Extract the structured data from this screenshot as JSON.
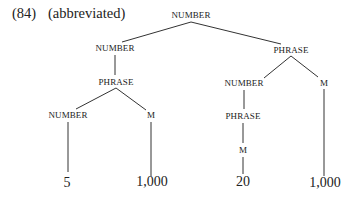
{
  "caption": {
    "number": "(84)",
    "note": "(abbreviated)"
  },
  "tree": {
    "nodes": [
      {
        "id": "n0",
        "label": "NUMBER",
        "x": 191,
        "y": 15,
        "kind": "node"
      },
      {
        "id": "n1",
        "label": "NUMBER",
        "x": 115,
        "y": 48,
        "kind": "node"
      },
      {
        "id": "n2",
        "label": "PHRASE",
        "x": 291,
        "y": 50,
        "kind": "node"
      },
      {
        "id": "n3",
        "label": "PHRASE",
        "x": 116,
        "y": 82,
        "kind": "node"
      },
      {
        "id": "n4",
        "label": "NUMBER",
        "x": 244,
        "y": 83,
        "kind": "node"
      },
      {
        "id": "n5",
        "label": "M",
        "x": 324,
        "y": 83,
        "kind": "node"
      },
      {
        "id": "n6",
        "label": "NUMBER",
        "x": 68,
        "y": 115,
        "kind": "node"
      },
      {
        "id": "n7",
        "label": "M",
        "x": 151,
        "y": 115,
        "kind": "node"
      },
      {
        "id": "n8",
        "label": "PHRASE",
        "x": 243,
        "y": 116,
        "kind": "node"
      },
      {
        "id": "n9",
        "label": "M",
        "x": 243,
        "y": 150,
        "kind": "node"
      },
      {
        "id": "l0",
        "label": "5",
        "x": 67,
        "y": 183,
        "kind": "leaf"
      },
      {
        "id": "l1",
        "label": "1,000",
        "x": 152,
        "y": 182,
        "kind": "leaf"
      },
      {
        "id": "l2",
        "label": "20",
        "x": 243,
        "y": 182,
        "kind": "leaf"
      },
      {
        "id": "l3",
        "label": "1,000",
        "x": 325,
        "y": 183,
        "kind": "leaf"
      }
    ],
    "edges": [
      {
        "x1": 191,
        "y1": 22,
        "x2": 122,
        "y2": 42
      },
      {
        "x1": 191,
        "y1": 22,
        "x2": 281,
        "y2": 44
      },
      {
        "x1": 115,
        "y1": 55,
        "x2": 115,
        "y2": 75
      },
      {
        "x1": 291,
        "y1": 56,
        "x2": 264,
        "y2": 78
      },
      {
        "x1": 291,
        "y1": 56,
        "x2": 318,
        "y2": 77
      },
      {
        "x1": 116,
        "y1": 88,
        "x2": 76,
        "y2": 109
      },
      {
        "x1": 116,
        "y1": 88,
        "x2": 146,
        "y2": 110
      },
      {
        "x1": 244,
        "y1": 90,
        "x2": 244,
        "y2": 109
      },
      {
        "x1": 324,
        "y1": 89,
        "x2": 324,
        "y2": 176
      },
      {
        "x1": 68,
        "y1": 122,
        "x2": 68,
        "y2": 172
      },
      {
        "x1": 151,
        "y1": 122,
        "x2": 151,
        "y2": 176
      },
      {
        "x1": 243,
        "y1": 123,
        "x2": 243,
        "y2": 143
      },
      {
        "x1": 243,
        "y1": 157,
        "x2": 243,
        "y2": 174
      }
    ],
    "line_color": "#333333"
  }
}
